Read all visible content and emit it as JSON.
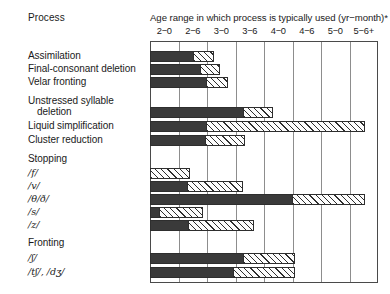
{
  "header": {
    "process_column": "Process",
    "axis_title": "Age range in which process is typically used (yr−month)*"
  },
  "chart_data": {
    "type": "bar",
    "orientation": "horizontal",
    "title": "Age range in which process is typically used (yr−month)*",
    "xlabel": "",
    "ylabel": "Process",
    "grid": true,
    "legend_position": "none",
    "x_tick_labels": [
      "2−0",
      "2−6",
      "3−0",
      "3−6",
      "4−0",
      "4−6",
      "5−0",
      "5−6+"
    ],
    "x_tick_values": [
      0,
      1,
      2,
      3,
      4,
      5,
      6,
      7
    ],
    "xlim": [
      0,
      8
    ],
    "series": [
      {
        "name": "typical use",
        "fill": "solid",
        "color": "#3a3a3a"
      },
      {
        "name": "declining / variable use",
        "fill": "hatched",
        "color": "#ffffff"
      }
    ],
    "rows": [
      {
        "label": "Assimilation",
        "type": "bar",
        "solid_start": 0.0,
        "solid_end": 1.55,
        "hatch_end": 2.25
      },
      {
        "label": "Final-consonant deletion",
        "type": "bar",
        "solid_start": 0.0,
        "solid_end": 1.8,
        "hatch_end": 2.45
      },
      {
        "label": "Velar fronting",
        "type": "bar",
        "solid_start": 0.0,
        "solid_end": 2.0,
        "hatch_end": 2.75
      },
      {
        "label": "Unstressed syllable",
        "type": "header-line-1"
      },
      {
        "label": "deletion",
        "type": "bar",
        "indent": true,
        "solid_start": 0.0,
        "solid_end": 3.3,
        "hatch_end": 4.3
      },
      {
        "label": "Liquid simplification",
        "type": "bar",
        "solid_start": 0.0,
        "solid_end": 1.95,
        "hatch_end": 7.55
      },
      {
        "label": "Cluster reduction",
        "type": "bar",
        "solid_start": 0.0,
        "solid_end": 1.95,
        "hatch_end": 3.35
      },
      {
        "label": "Stopping",
        "type": "group-header"
      },
      {
        "label": "/f/",
        "ipa": true,
        "type": "bar",
        "solid_start": 0.0,
        "solid_end": 0.0,
        "hatch_end": 1.4
      },
      {
        "label": "/v/",
        "ipa": true,
        "type": "bar",
        "solid_start": 0.0,
        "solid_end": 1.3,
        "hatch_end": 3.25
      },
      {
        "label": "/θ/ð/",
        "ipa": true,
        "type": "bar",
        "solid_start": 0.0,
        "solid_end": 5.0,
        "hatch_end": 7.55
      },
      {
        "label": "/s/",
        "ipa": true,
        "type": "bar",
        "solid_start": 0.0,
        "solid_end": 0.28,
        "hatch_end": 1.85
      },
      {
        "label": "/z/",
        "ipa": true,
        "type": "bar",
        "solid_start": 0.0,
        "solid_end": 1.35,
        "hatch_end": 3.65
      },
      {
        "label": "Fronting",
        "type": "group-header"
      },
      {
        "label": "/ʃ/",
        "ipa": true,
        "type": "bar",
        "solid_start": 0.0,
        "solid_end": 3.3,
        "hatch_end": 5.1
      },
      {
        "label": "/tʃ/, /dʒ/",
        "ipa": true,
        "type": "bar",
        "solid_start": 0.0,
        "solid_end": 2.95,
        "hatch_end": 5.1
      }
    ]
  }
}
